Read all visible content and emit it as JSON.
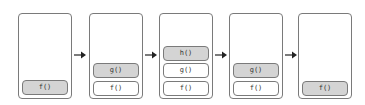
{
  "diagram": {
    "type": "call-stack-sequence",
    "colors": {
      "border": "#7a7a7a",
      "active_frame_fill": "#d4d4d4",
      "inactive_frame_fill": "#ffffff",
      "arrow": "#222222"
    },
    "stacks": [
      {
        "frames": [
          {
            "label": "f()",
            "active": true
          }
        ]
      },
      {
        "frames": [
          {
            "label": "g()",
            "active": true
          },
          {
            "label": "f()",
            "active": false
          }
        ]
      },
      {
        "frames": [
          {
            "label": "h()",
            "active": true
          },
          {
            "label": "g()",
            "active": false
          },
          {
            "label": "f()",
            "active": false
          }
        ]
      },
      {
        "frames": [
          {
            "label": "g()",
            "active": true
          },
          {
            "label": "f()",
            "active": false
          }
        ]
      },
      {
        "frames": [
          {
            "label": "f()",
            "active": true
          }
        ]
      }
    ],
    "arrows": [
      {
        "from": 0,
        "to": 1,
        "icon": "arrow-right-icon"
      },
      {
        "from": 1,
        "to": 2,
        "icon": "arrow-right-icon"
      },
      {
        "from": 2,
        "to": 3,
        "icon": "arrow-right-icon"
      },
      {
        "from": 3,
        "to": 4,
        "icon": "arrow-right-icon"
      }
    ]
  }
}
